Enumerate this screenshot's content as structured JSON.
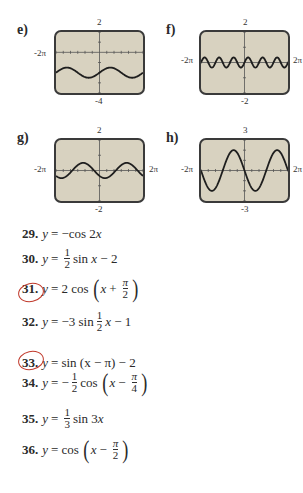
{
  "graphs": [
    {
      "id": "e",
      "label": "e)",
      "ymax": "2",
      "ymin": "-4",
      "xmin": "-2π",
      "xmax": "2π",
      "range": [
        -4,
        2
      ],
      "formula": "0.5*Math.sin(x)-2",
      "xmax_visible": false
    },
    {
      "id": "f",
      "label": "f)",
      "ymax": "2",
      "ymin": "-2",
      "xmin": "-2π",
      "xmax": "2π",
      "range": [
        -2,
        2
      ],
      "formula": "(1/3)*Math.sin(3*x)",
      "xmax_visible": true
    },
    {
      "id": "g",
      "label": "g)",
      "ymax": "2",
      "ymin": "-2",
      "xmin": "-2π",
      "xmax": "2π",
      "range": [
        -2,
        2
      ],
      "formula": "-0.5*Math.cos(x-Math.PI/4)",
      "xmax_visible": true
    },
    {
      "id": "h",
      "label": "h)",
      "ymax": "3",
      "ymin": "-3",
      "xmin": "-2π",
      "xmax": "2π",
      "range": [
        -3,
        3
      ],
      "formula": "2*Math.cos(x+Math.PI/2)",
      "xmax_visible": true
    }
  ],
  "problems": [
    {
      "num": "29.",
      "circled": false
    },
    {
      "num": "30.",
      "circled": false
    },
    {
      "num": "31.",
      "circled": true
    },
    {
      "num": "32.",
      "circled": false
    },
    {
      "num": "33.",
      "circled": true
    },
    {
      "num": "34.",
      "circled": false
    },
    {
      "num": "35.",
      "circled": false
    },
    {
      "num": "36.",
      "circled": false
    }
  ],
  "text": {
    "y": "y",
    "eq": "=",
    "p29": "−cos 2",
    "x": "x",
    "one": "1",
    "two": "2",
    "three": "3",
    "four": "4",
    "pi": "π",
    "sinx": "sin",
    "minus2": "− 2",
    "minus1": "− 1",
    "cos": "cos",
    "p31coef": "2 cos",
    "plus": "+",
    "minus": "−",
    "p32coef": "−3 sin",
    "p33": "sin (x − π) − 2",
    "neg": "−",
    "p35sin": "sin 3",
    "lparen": "(",
    "rparen": ")"
  },
  "colors": {
    "screen": "#d8d2c0",
    "curve": "#1e1e1e",
    "annotation": "#c0392b"
  }
}
